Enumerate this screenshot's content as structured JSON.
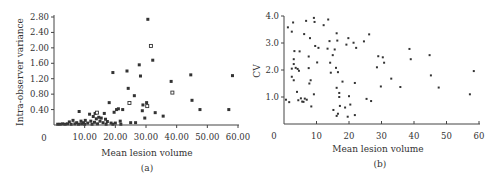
{
  "chart_data": [
    {
      "id": "a",
      "type": "scatter",
      "title": "",
      "panel_label": "(a)",
      "xlabel": "Mean lesion volume",
      "ylabel": "Intra-observer variance",
      "xlim": [
        0,
        60
      ],
      "ylim": [
        0,
        2.8
      ],
      "origin_label": "0",
      "xticks": [
        10,
        20,
        30,
        40,
        50,
        60
      ],
      "xtick_labels": [
        "10.00",
        "20.00",
        "30.00",
        "40.00",
        "50.00",
        "60.00"
      ],
      "yticks": [
        0.4,
        0.8,
        1.2,
        1.6,
        2.0,
        2.4,
        2.8
      ],
      "ytick_labels": [
        "0.40",
        "0.80",
        "1.20",
        "1.60",
        "2.00",
        "2.40",
        "2.80"
      ],
      "grid": false,
      "points": [
        {
          "x": 30.6,
          "y": 2.74,
          "m": "filled"
        },
        {
          "x": 31.6,
          "y": 2.05,
          "m": "open"
        },
        {
          "x": 32.2,
          "y": 1.68,
          "m": "filled"
        },
        {
          "x": 27.8,
          "y": 1.56,
          "m": "filled"
        },
        {
          "x": 19.2,
          "y": 1.36,
          "m": "filled"
        },
        {
          "x": 23.8,
          "y": 1.4,
          "m": "filled"
        },
        {
          "x": 28.2,
          "y": 1.27,
          "m": "filled"
        },
        {
          "x": 44.6,
          "y": 1.3,
          "m": "filled"
        },
        {
          "x": 58.2,
          "y": 1.28,
          "m": "filled"
        },
        {
          "x": 38.2,
          "y": 1.13,
          "m": "filled"
        },
        {
          "x": 24.2,
          "y": 0.95,
          "m": "filled"
        },
        {
          "x": 38.6,
          "y": 0.84,
          "m": "open"
        },
        {
          "x": 26.2,
          "y": 0.76,
          "m": "filled"
        },
        {
          "x": 45.0,
          "y": 0.64,
          "m": "filled"
        },
        {
          "x": 18.0,
          "y": 0.58,
          "m": "filled"
        },
        {
          "x": 24.6,
          "y": 0.57,
          "m": "open"
        },
        {
          "x": 29.0,
          "y": 0.52,
          "m": "filled"
        },
        {
          "x": 30.2,
          "y": 0.58,
          "m": "filled"
        },
        {
          "x": 30.4,
          "y": 0.49,
          "m": "open"
        },
        {
          "x": 47.6,
          "y": 0.4,
          "m": "filled"
        },
        {
          "x": 57.0,
          "y": 0.4,
          "m": "filled"
        },
        {
          "x": 21.0,
          "y": 0.42,
          "m": "filled"
        },
        {
          "x": 20.4,
          "y": 0.4,
          "m": "filled"
        },
        {
          "x": 22.4,
          "y": 0.4,
          "m": "filled"
        },
        {
          "x": 28.8,
          "y": 0.37,
          "m": "filled"
        },
        {
          "x": 19.6,
          "y": 0.33,
          "m": "filled"
        },
        {
          "x": 33.0,
          "y": 0.32,
          "m": "filled"
        },
        {
          "x": 8.2,
          "y": 0.35,
          "m": "filled"
        },
        {
          "x": 13.4,
          "y": 0.3,
          "m": "filled"
        },
        {
          "x": 14.0,
          "y": 0.32,
          "m": "open"
        },
        {
          "x": 16.4,
          "y": 0.3,
          "m": "filled"
        },
        {
          "x": 11.6,
          "y": 0.28,
          "m": "filled"
        },
        {
          "x": 12.8,
          "y": 0.22,
          "m": "filled"
        },
        {
          "x": 14.6,
          "y": 0.2,
          "m": "filled"
        },
        {
          "x": 15.4,
          "y": 0.18,
          "m": "filled"
        },
        {
          "x": 13.8,
          "y": 0.16,
          "m": "filled"
        },
        {
          "x": 16.8,
          "y": 0.15,
          "m": "filled"
        },
        {
          "x": 29.6,
          "y": 0.18,
          "m": "filled"
        },
        {
          "x": 35.6,
          "y": 0.23,
          "m": "filled"
        },
        {
          "x": 6.2,
          "y": 0.12,
          "m": "filled"
        },
        {
          "x": 8.8,
          "y": 0.1,
          "m": "filled"
        },
        {
          "x": 10.2,
          "y": 0.12,
          "m": "filled"
        },
        {
          "x": 12.0,
          "y": 0.1,
          "m": "filled"
        },
        {
          "x": 15.0,
          "y": 0.1,
          "m": "filled"
        },
        {
          "x": 17.4,
          "y": 0.09,
          "m": "filled"
        },
        {
          "x": 21.6,
          "y": 0.1,
          "m": "filled"
        },
        {
          "x": 5.0,
          "y": 0.08,
          "m": "filled"
        },
        {
          "x": 7.4,
          "y": 0.06,
          "m": "filled"
        },
        {
          "x": 9.6,
          "y": 0.06,
          "m": "filled"
        },
        {
          "x": 11.0,
          "y": 0.05,
          "m": "filled"
        },
        {
          "x": 13.2,
          "y": 0.07,
          "m": "filled"
        },
        {
          "x": 16.0,
          "y": 0.06,
          "m": "filled"
        },
        {
          "x": 18.6,
          "y": 0.05,
          "m": "filled"
        },
        {
          "x": 20.0,
          "y": 0.05,
          "m": "filled"
        },
        {
          "x": 25.0,
          "y": 0.06,
          "m": "filled"
        },
        {
          "x": 26.6,
          "y": 0.06,
          "m": "filled"
        },
        {
          "x": 1.2,
          "y": 0.02,
          "m": "filled"
        },
        {
          "x": 2.0,
          "y": 0.02,
          "m": "filled"
        },
        {
          "x": 2.8,
          "y": 0.03,
          "m": "filled"
        },
        {
          "x": 3.6,
          "y": 0.02,
          "m": "filled"
        },
        {
          "x": 4.4,
          "y": 0.03,
          "m": "filled"
        },
        {
          "x": 5.6,
          "y": 0.02,
          "m": "filled"
        },
        {
          "x": 6.8,
          "y": 0.03,
          "m": "filled"
        },
        {
          "x": 8.0,
          "y": 0.02,
          "m": "filled"
        },
        {
          "x": 9.0,
          "y": 0.03,
          "m": "filled"
        },
        {
          "x": 10.0,
          "y": 0.02,
          "m": "filled"
        },
        {
          "x": 12.4,
          "y": 0.02,
          "m": "filled"
        },
        {
          "x": 14.2,
          "y": 0.03,
          "m": "filled"
        },
        {
          "x": 17.0,
          "y": 0.02,
          "m": "filled"
        },
        {
          "x": 19.2,
          "y": 0.02,
          "m": "filled"
        },
        {
          "x": 21.8,
          "y": 0.02,
          "m": "filled"
        }
      ]
    },
    {
      "id": "b",
      "type": "scatter",
      "title": "",
      "panel_label": "(b)",
      "xlabel": "Mean lesion volume",
      "ylabel": "CV",
      "xlim": [
        0,
        60
      ],
      "ylim": [
        0,
        4.0
      ],
      "origin_label": "0",
      "xticks": [
        10,
        20,
        30,
        40,
        50,
        60
      ],
      "xtick_labels": [
        "10",
        "20",
        "30",
        "40",
        "50",
        "60"
      ],
      "yticks": [
        1.0,
        2.0,
        3.0,
        4.0
      ],
      "ytick_labels": [
        "1.0",
        "2.0",
        "3.0",
        "4.0"
      ],
      "grid": false,
      "points": [
        {
          "x": 9.2,
          "y": 3.93
        },
        {
          "x": 13.6,
          "y": 3.87
        },
        {
          "x": 6.8,
          "y": 3.82
        },
        {
          "x": 9.4,
          "y": 3.78
        },
        {
          "x": 2.8,
          "y": 3.76
        },
        {
          "x": 12.2,
          "y": 3.66
        },
        {
          "x": 1.2,
          "y": 3.58
        },
        {
          "x": 2.4,
          "y": 3.42
        },
        {
          "x": 16.2,
          "y": 3.36
        },
        {
          "x": 26.2,
          "y": 3.32
        },
        {
          "x": 6.2,
          "y": 3.33
        },
        {
          "x": 8.0,
          "y": 3.18
        },
        {
          "x": 19.8,
          "y": 3.18
        },
        {
          "x": 14.0,
          "y": 3.07
        },
        {
          "x": 16.4,
          "y": 3.09
        },
        {
          "x": 21.4,
          "y": 3.01
        },
        {
          "x": 24.6,
          "y": 3.06
        },
        {
          "x": 9.6,
          "y": 2.89
        },
        {
          "x": 10.6,
          "y": 2.82
        },
        {
          "x": 13.4,
          "y": 2.79
        },
        {
          "x": 15.6,
          "y": 2.76
        },
        {
          "x": 19.2,
          "y": 2.94
        },
        {
          "x": 22.2,
          "y": 2.82
        },
        {
          "x": 38.6,
          "y": 2.78
        },
        {
          "x": 3.2,
          "y": 2.7
        },
        {
          "x": 4.8,
          "y": 2.69
        },
        {
          "x": 15.0,
          "y": 2.55
        },
        {
          "x": 7.6,
          "y": 2.5
        },
        {
          "x": 29.0,
          "y": 2.51
        },
        {
          "x": 30.4,
          "y": 2.47
        },
        {
          "x": 44.8,
          "y": 2.55
        },
        {
          "x": 3.0,
          "y": 2.4
        },
        {
          "x": 10.2,
          "y": 2.28
        },
        {
          "x": 14.2,
          "y": 2.27
        },
        {
          "x": 30.8,
          "y": 2.27
        },
        {
          "x": 39.0,
          "y": 2.4
        },
        {
          "x": 3.0,
          "y": 2.22
        },
        {
          "x": 2.4,
          "y": 2.05
        },
        {
          "x": 3.6,
          "y": 2.08
        },
        {
          "x": 4.2,
          "y": 2.04
        },
        {
          "x": 7.6,
          "y": 2.07
        },
        {
          "x": 16.0,
          "y": 2.08
        },
        {
          "x": 28.6,
          "y": 2.1
        },
        {
          "x": 4.6,
          "y": 1.97
        },
        {
          "x": 14.4,
          "y": 1.9
        },
        {
          "x": 16.6,
          "y": 1.92
        },
        {
          "x": 58.4,
          "y": 1.96
        },
        {
          "x": 2.4,
          "y": 1.75
        },
        {
          "x": 45.2,
          "y": 1.8
        },
        {
          "x": 3.0,
          "y": 1.62
        },
        {
          "x": 8.2,
          "y": 1.62
        },
        {
          "x": 18.0,
          "y": 1.57
        },
        {
          "x": 33.0,
          "y": 1.68
        },
        {
          "x": 7.8,
          "y": 1.5
        },
        {
          "x": 21.8,
          "y": 1.52
        },
        {
          "x": 16.2,
          "y": 1.34
        },
        {
          "x": 29.8,
          "y": 1.39
        },
        {
          "x": 35.8,
          "y": 1.37
        },
        {
          "x": 47.6,
          "y": 1.35
        },
        {
          "x": 4.0,
          "y": 1.19
        },
        {
          "x": 17.0,
          "y": 1.15
        },
        {
          "x": 9.2,
          "y": 1.1
        },
        {
          "x": 57.2,
          "y": 1.1
        },
        {
          "x": 17.0,
          "y": 1.0
        },
        {
          "x": 20.0,
          "y": 1.03
        },
        {
          "x": 0.6,
          "y": 0.9
        },
        {
          "x": 5.2,
          "y": 0.95
        },
        {
          "x": 6.4,
          "y": 0.94
        },
        {
          "x": 4.4,
          "y": 0.88
        },
        {
          "x": 7.0,
          "y": 0.9
        },
        {
          "x": 25.4,
          "y": 0.93
        },
        {
          "x": 1.6,
          "y": 0.81
        },
        {
          "x": 5.6,
          "y": 0.83
        },
        {
          "x": 6.0,
          "y": 0.82
        },
        {
          "x": 26.8,
          "y": 0.85
        },
        {
          "x": 17.2,
          "y": 0.67
        },
        {
          "x": 20.4,
          "y": 0.72
        },
        {
          "x": 8.4,
          "y": 0.65
        },
        {
          "x": 18.8,
          "y": 0.61
        },
        {
          "x": 15.2,
          "y": 0.52
        },
        {
          "x": 16.6,
          "y": 0.38
        },
        {
          "x": 21.8,
          "y": 0.33
        },
        {
          "x": 16.2,
          "y": 0.3
        },
        {
          "x": 19.6,
          "y": 0.27
        }
      ]
    }
  ]
}
